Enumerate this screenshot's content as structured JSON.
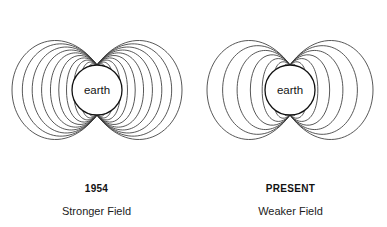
{
  "figure": {
    "background_color": "#ffffff",
    "line_color": "#3a3a3a",
    "earth_outline_color": "#111111",
    "earth_fill_color": "#ffffff"
  },
  "panels": [
    {
      "id": "panel-1954",
      "era_label": "1954",
      "strength_label": "Stronger Field",
      "earth_label": "earth",
      "field_line_count": 11,
      "center": {
        "x": 97,
        "y": 90
      },
      "earth_radius": 25,
      "north_pole": {
        "x": 97,
        "y": 65
      },
      "south_pole": {
        "x": 97,
        "y": 115
      },
      "outer_extent_x": 80
    },
    {
      "id": "panel-present",
      "era_label": "PRESENT",
      "strength_label": "Weaker Field",
      "earth_label": "earth",
      "field_line_count": 7,
      "center": {
        "x": 96,
        "y": 90
      },
      "earth_radius": 25,
      "north_pole": {
        "x": 96,
        "y": 65
      },
      "south_pole": {
        "x": 96,
        "y": 115
      },
      "outer_extent_x": 78
    }
  ],
  "chart_data": {
    "type": "diagram",
    "categories": [
      "1954",
      "PRESENT"
    ],
    "values": [
      11,
      7
    ],
    "ylabel": "Number of field lines drawn",
    "annotations": [
      "Stronger Field",
      "Weaker Field"
    ],
    "legend": []
  }
}
